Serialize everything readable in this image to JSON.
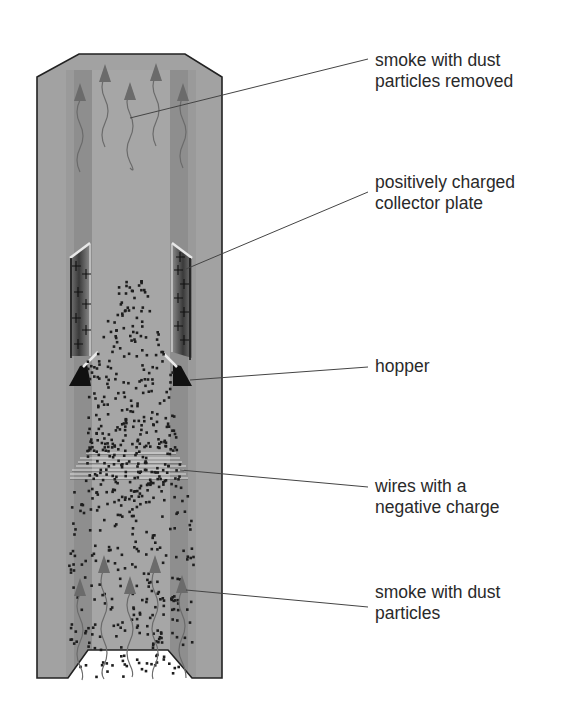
{
  "colors": {
    "outer_wall": "#a2a2a2",
    "inner_stripe": "#8e8e8e",
    "center_channel": "#a6a6a6",
    "outline": "#222222",
    "arrow": "#6b6b6b",
    "particle": "#1e1e1e",
    "plate_dark": "#3a3a3a",
    "hopper": "#111111",
    "leader": "#444444",
    "opening": "#ffffff"
  },
  "labels": [
    {
      "id": "clean-smoke",
      "text": "smoke with dust\nparticles removed",
      "y": 50,
      "line": {
        "x1": 130,
        "y1": 118,
        "x2": 368,
        "y2": 59
      }
    },
    {
      "id": "collector-plate",
      "text": "positively charged\ncollector plate",
      "y": 172,
      "line": {
        "x1": 186,
        "y1": 269,
        "x2": 368,
        "y2": 192
      }
    },
    {
      "id": "hopper",
      "text": "hopper",
      "y": 356,
      "line": {
        "x1": 190,
        "y1": 380,
        "x2": 368,
        "y2": 367
      }
    },
    {
      "id": "wires",
      "text": "wires with a\nnegative charge",
      "y": 476,
      "line": {
        "x1": 180,
        "y1": 470,
        "x2": 368,
        "y2": 487
      }
    },
    {
      "id": "dirty-smoke",
      "text": "smoke with dust\nparticles",
      "y": 582,
      "line": {
        "x1": 186,
        "y1": 590,
        "x2": 368,
        "y2": 607
      }
    }
  ],
  "chimney": {
    "outer": [
      [
        37,
        77
      ],
      [
        79,
        54
      ],
      [
        185,
        54
      ],
      [
        222,
        77
      ],
      [
        222,
        678
      ],
      [
        37,
        678
      ]
    ],
    "opening": [
      [
        88,
        650
      ],
      [
        168,
        650
      ],
      [
        192,
        678
      ],
      [
        68,
        678
      ]
    ]
  }
}
